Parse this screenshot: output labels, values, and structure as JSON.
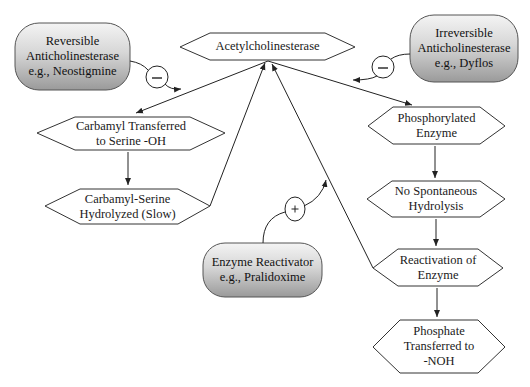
{
  "diagram": {
    "nodes": {
      "acetylcholinesterase": {
        "shape": "hexagon",
        "lines": [
          "Acetylcholinesterase"
        ]
      },
      "reversible": {
        "shape": "pill",
        "lines": [
          "Reversible",
          "Anticholinesterase",
          "e.g., Neostigmine"
        ]
      },
      "irreversible": {
        "shape": "pill",
        "lines": [
          "Irreversible",
          "Anticholinesterase",
          "e.g., Dyflos"
        ]
      },
      "carbamyl_transferred": {
        "shape": "hexagon",
        "lines": [
          "Carbamyl Transferred",
          "to Serine -OH"
        ]
      },
      "carbamyl_hydrolyzed": {
        "shape": "hexagon",
        "lines": [
          "Carbamyl-Serine",
          "Hydrolyzed (Slow)"
        ]
      },
      "phosphorylated": {
        "shape": "hexagon",
        "lines": [
          "Phosphorylated",
          "Enzyme"
        ]
      },
      "no_hydrolysis": {
        "shape": "hexagon",
        "lines": [
          "No Spontaneous",
          "Hydrolysis"
        ]
      },
      "reactivation": {
        "shape": "hexagon",
        "lines": [
          "Reactivation of",
          "Enzyme"
        ]
      },
      "phosphate_transferred": {
        "shape": "hexagon",
        "lines": [
          "Phosphate",
          "Transferred to",
          "-NOH"
        ]
      },
      "reactivator": {
        "shape": "pill",
        "lines": [
          "Enzyme Reactivator",
          "e.g., Pralidoxime"
        ]
      }
    },
    "modifiers": {
      "reversible_inhibit": {
        "symbol": "–",
        "meaning": "inhibits"
      },
      "irreversible_inhibit": {
        "symbol": "–",
        "meaning": "inhibits"
      },
      "reactivator_promote": {
        "symbol": "+",
        "meaning": "promotes"
      }
    },
    "edges": [
      {
        "from": "acetylcholinesterase",
        "to": "carbamyl_transferred"
      },
      {
        "from": "carbamyl_transferred",
        "to": "carbamyl_hydrolyzed"
      },
      {
        "from": "carbamyl_hydrolyzed",
        "to": "acetylcholinesterase"
      },
      {
        "from": "acetylcholinesterase",
        "to": "phosphorylated"
      },
      {
        "from": "phosphorylated",
        "to": "no_hydrolysis"
      },
      {
        "from": "no_hydrolysis",
        "to": "reactivation"
      },
      {
        "from": "reactivation",
        "to": "phosphate_transferred"
      },
      {
        "from": "reactivation",
        "to": "acetylcholinesterase"
      },
      {
        "from": "reversible",
        "to": "carbamyl_transferred_edge",
        "modifier": "reversible_inhibit"
      },
      {
        "from": "irreversible",
        "to": "phosphorylated_edge",
        "modifier": "irreversible_inhibit"
      },
      {
        "from": "reactivator",
        "to": "reactivation_edge",
        "modifier": "reactivator_promote"
      }
    ]
  }
}
